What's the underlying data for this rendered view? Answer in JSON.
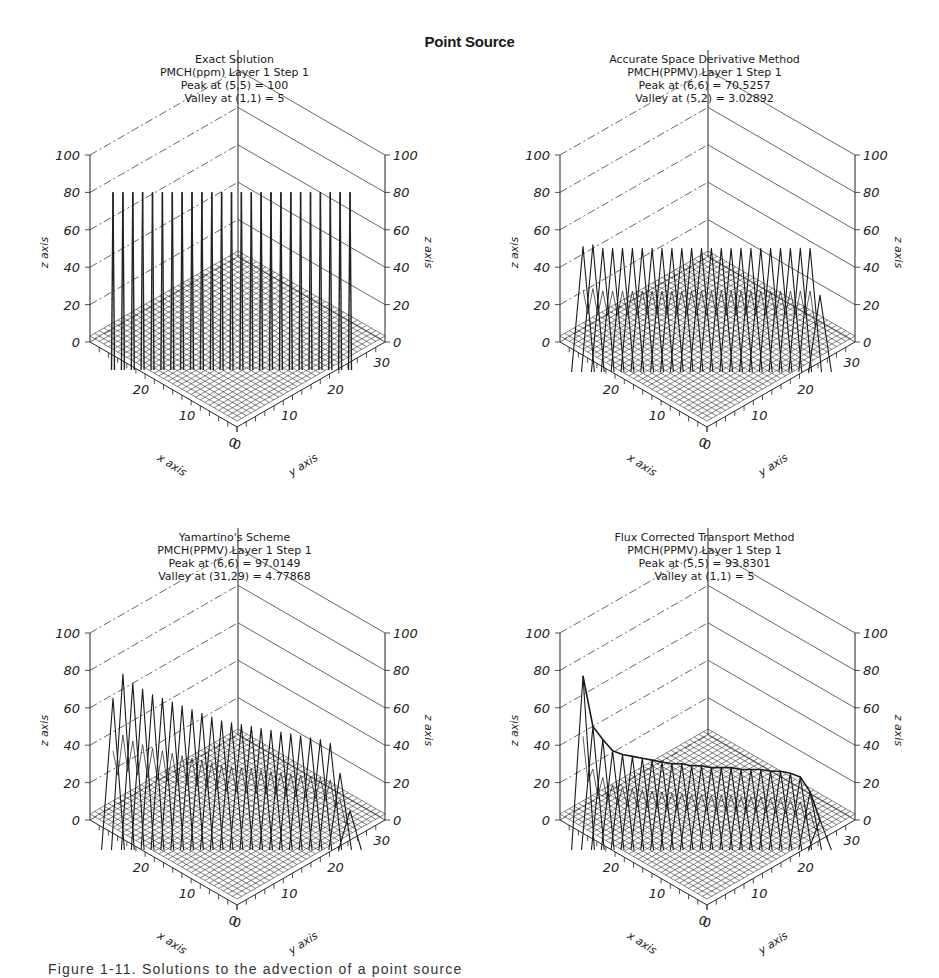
{
  "figure": {
    "title": "Point Source",
    "caption": "Figure 1-11.  Solutions to the advection of a point source"
  },
  "chart_data": [
    {
      "type": "surface3d",
      "title": "Exact Solution",
      "subtitle": [
        "PMCH(ppm)  Layer 1  Step 1",
        "Peak at (5,5) = 100",
        "Valley at (1,1) = 5"
      ],
      "xlabel": "x axis",
      "ylabel": "y axis",
      "zlabel": "z axis",
      "xticks": [
        0,
        10,
        20
      ],
      "yticks": [
        0,
        10,
        20,
        30
      ],
      "zticks": [
        0,
        20,
        40,
        60,
        80,
        100
      ],
      "xlim": [
        0,
        32
      ],
      "ylim": [
        0,
        32
      ],
      "zlim": [
        0,
        100
      ],
      "peak": {
        "x": 5,
        "y": 5,
        "value": 100
      },
      "valley": {
        "x": 1,
        "y": 1,
        "value": 5
      },
      "ridge_heights": [
        95,
        95,
        95,
        95,
        95,
        95,
        95,
        95,
        95,
        95,
        95,
        95,
        95,
        95,
        95,
        95,
        95,
        95,
        95,
        95,
        95,
        95,
        95,
        95,
        95
      ],
      "shape": "spikes"
    },
    {
      "type": "surface3d",
      "title": "Accurate Space Derivative Method",
      "subtitle": [
        "PMCH(PPMV)  Layer 1  Step 1",
        "Peak at (6,6) = 70.5257",
        "Valley at (5,2) = 3.02892"
      ],
      "xlabel": "x axis",
      "ylabel": "y axis",
      "zlabel": "z axis",
      "xticks": [
        0,
        10,
        20
      ],
      "yticks": [
        0,
        10,
        20,
        30
      ],
      "zticks": [
        0,
        20,
        40,
        60,
        80,
        100
      ],
      "xlim": [
        0,
        32
      ],
      "ylim": [
        0,
        32
      ],
      "zlim": [
        0,
        100
      ],
      "peak": {
        "x": 6,
        "y": 6,
        "value": 70.5257
      },
      "valley": {
        "x": 5,
        "y": 2,
        "value": 3.02892
      },
      "ridge_heights": [
        66,
        67,
        65,
        65,
        65,
        65,
        65,
        65,
        65,
        65,
        65,
        65,
        65,
        65,
        65,
        65,
        65,
        65,
        65,
        65,
        65,
        65,
        65,
        65,
        40
      ],
      "shape": "peaks"
    },
    {
      "type": "surface3d",
      "title": "Yamartino's Scheme",
      "subtitle": [
        "PMCH(PPMV)  Layer 1  Step 1",
        "Peak at (6,6) = 97.0149",
        "Valley at (31,29) = 4.77868"
      ],
      "xlabel": "x axis",
      "ylabel": "y axis",
      "zlabel": "z axis",
      "xticks": [
        0,
        10,
        20
      ],
      "yticks": [
        0,
        10,
        20,
        30
      ],
      "zticks": [
        0,
        20,
        40,
        60,
        80,
        100
      ],
      "xlim": [
        0,
        32
      ],
      "ylim": [
        0,
        32
      ],
      "zlim": [
        0,
        100
      ],
      "peak": {
        "x": 6,
        "y": 6,
        "value": 97.0149
      },
      "valley": {
        "x": 31,
        "y": 29,
        "value": 4.77868
      },
      "ridge_heights": [
        80,
        93,
        88,
        85,
        82,
        80,
        78,
        76,
        74,
        72,
        70,
        68,
        67,
        66,
        65,
        64,
        63,
        62,
        61,
        60,
        59,
        58,
        56,
        40,
        20
      ],
      "shape": "peaks"
    },
    {
      "type": "surface3d",
      "title": "Flux Corrected Transport Method",
      "subtitle": [
        "PMCH(PPMV)  Layer 1  Step 1",
        "Peak at (5,5) = 93.8301",
        "Valley at (1,1) = 5"
      ],
      "xlabel": "x axis",
      "ylabel": "y axis",
      "zlabel": "z axis",
      "xticks": [
        0,
        10,
        20
      ],
      "yticks": [
        0,
        10,
        20,
        30
      ],
      "zticks": [
        0,
        20,
        40,
        60,
        80,
        100
      ],
      "xlim": [
        0,
        32
      ],
      "ylim": [
        0,
        32
      ],
      "zlim": [
        0,
        100
      ],
      "peak": {
        "x": 5,
        "y": 5,
        "value": 93.8301
      },
      "valley": {
        "x": 1,
        "y": 1,
        "value": 5
      },
      "ridge_heights": [
        92,
        65,
        58,
        52,
        50,
        49,
        48,
        47,
        46,
        45,
        45,
        44,
        44,
        43,
        43,
        43,
        42,
        42,
        42,
        41,
        41,
        40,
        38,
        30,
        15
      ],
      "shape": "smooth"
    }
  ]
}
